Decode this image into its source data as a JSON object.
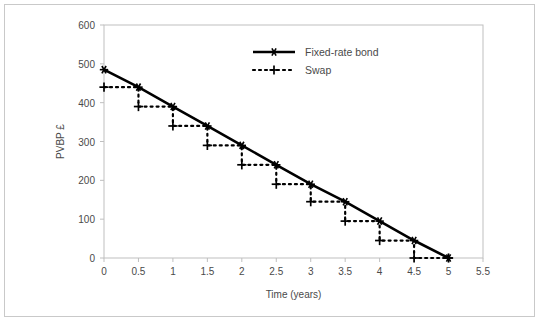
{
  "chart_data": {
    "type": "line",
    "title": "",
    "xlabel": "Time (years)",
    "ylabel": "PVBP £",
    "xlim": [
      0,
      5.5
    ],
    "ylim": [
      0,
      600
    ],
    "xticks": [
      0,
      0.5,
      1,
      1.5,
      2,
      2.5,
      3,
      3.5,
      4,
      4.5,
      5,
      5.5
    ],
    "xtick_labels": [
      "0",
      "0.5",
      "1",
      "1.5",
      "2",
      "2.5",
      "3",
      "3.5",
      "4",
      "4.5",
      "5",
      "5.5"
    ],
    "yticks": [
      0,
      100,
      200,
      300,
      400,
      500,
      600
    ],
    "ytick_labels": [
      "0",
      "100",
      "200",
      "300",
      "400",
      "500",
      "600"
    ],
    "grid": false,
    "legend_position": "top-center",
    "x": [
      0,
      0.5,
      1,
      1.5,
      2,
      2.5,
      3,
      3.5,
      4,
      4.5,
      5
    ],
    "series": [
      {
        "name": "Fixed-rate bond",
        "marker": "asterisk",
        "linestyle": "solid",
        "color": "#000000",
        "values": [
          485,
          440,
          390,
          340,
          290,
          240,
          190,
          145,
          95,
          45,
          0
        ]
      },
      {
        "name": "Swap",
        "marker": "plus",
        "linestyle": "dotted-step",
        "color": "#000000",
        "values": [
          440,
          390,
          340,
          290,
          240,
          190,
          145,
          95,
          45,
          0,
          0
        ]
      }
    ]
  },
  "legend": {
    "items": [
      {
        "label": "Fixed-rate bond",
        "style": "solid-asterisk"
      },
      {
        "label": "Swap",
        "style": "dotted-plus"
      }
    ]
  },
  "colors": {
    "series": "#000000",
    "axis": "#bfbfbf",
    "tick_text": "#4a4a4a",
    "frame": "#c9c9c9",
    "background": "#ffffff"
  }
}
